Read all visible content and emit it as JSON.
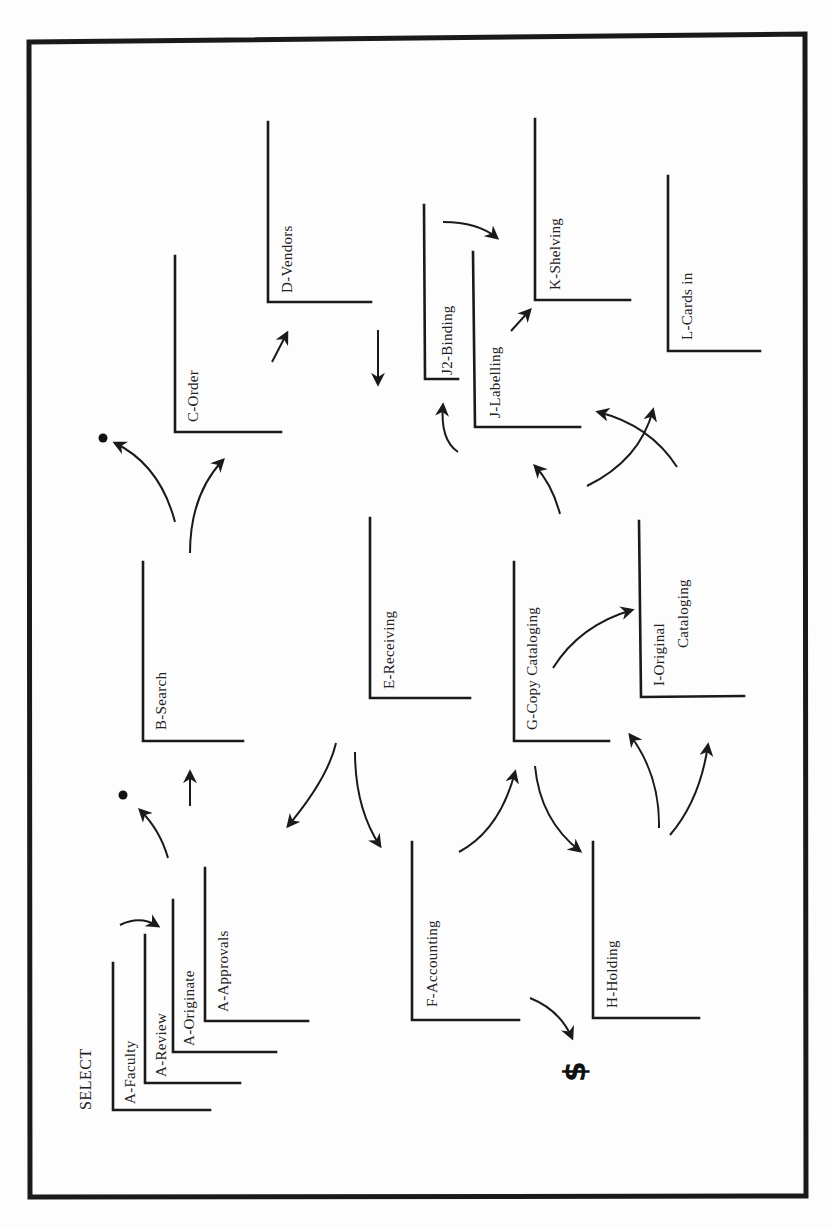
{
  "diagram": {
    "title": "SELECT",
    "stations": [
      {
        "id": "a-faculty",
        "label": "A-Faculty"
      },
      {
        "id": "a-review",
        "label": "A-Review"
      },
      {
        "id": "a-originate",
        "label": "A-Originate"
      },
      {
        "id": "a-approvals",
        "label": "A-Approvals"
      },
      {
        "id": "b-search",
        "label": "B-Search"
      },
      {
        "id": "c-order",
        "label": "C-Order"
      },
      {
        "id": "d-vendors",
        "label": "D-Vendors"
      },
      {
        "id": "e-receiving",
        "label": "E-Receiving"
      },
      {
        "id": "f-accounting",
        "label": "F-Accounting"
      },
      {
        "id": "g-copy-cataloging",
        "label": "G-Copy  Cataloging"
      },
      {
        "id": "h-holding",
        "label": "H-Holding"
      },
      {
        "id": "i-original-cataloging",
        "label_line1": "I-Original",
        "label_line2": "Cataloging"
      },
      {
        "id": "j2-binding",
        "label": "J2-Binding"
      },
      {
        "id": "j-labelling",
        "label": "J-Labelling"
      },
      {
        "id": "k-shelving",
        "label": "K-Shelving"
      },
      {
        "id": "l-cards-in",
        "label": "L-Cards  in"
      }
    ],
    "symbols": {
      "dollar": "$"
    },
    "colors": {
      "ink": "#1a1a1a",
      "paper": "#fdfdfd"
    }
  }
}
